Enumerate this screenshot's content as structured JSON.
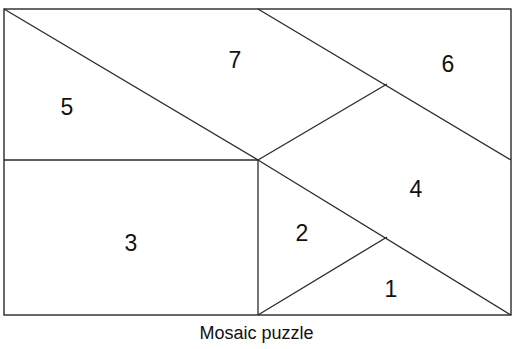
{
  "caption": "Mosaic puzzle",
  "colors": {
    "line": "#2a2a2a",
    "text": "#111111",
    "background": "#ffffff"
  },
  "frame": {
    "x1": 4,
    "y1": 9,
    "x2": 511,
    "y2": 315
  },
  "segments": [
    {
      "name": "diagonal-top-left-to-center",
      "x1": 4,
      "y1": 9,
      "x2": 258,
      "y2": 160
    },
    {
      "name": "diagonal-top-mid-to-right",
      "x1": 258,
      "y1": 9,
      "x2": 511,
      "y2": 160
    },
    {
      "name": "horizontal-left-mid",
      "x1": 4,
      "y1": 160,
      "x2": 258,
      "y2": 160
    },
    {
      "name": "vertical-center",
      "x1": 258,
      "y1": 160,
      "x2": 258,
      "y2": 315
    },
    {
      "name": "diagonal-center-up-right",
      "x1": 258,
      "y1": 160,
      "x2": 387,
      "y2": 84
    },
    {
      "name": "diagonal-center-to-bottom-right",
      "x1": 258,
      "y1": 160,
      "x2": 511,
      "y2": 315
    },
    {
      "name": "diagonal-bottom-center-up-right",
      "x1": 258,
      "y1": 315,
      "x2": 387,
      "y2": 237
    }
  ],
  "pieces": [
    {
      "id": "1",
      "label": "1",
      "x": 391,
      "y": 289
    },
    {
      "id": "2",
      "label": "2",
      "x": 302,
      "y": 233
    },
    {
      "id": "3",
      "label": "3",
      "x": 131,
      "y": 243
    },
    {
      "id": "4",
      "label": "4",
      "x": 416,
      "y": 189
    },
    {
      "id": "5",
      "label": "5",
      "x": 67,
      "y": 107
    },
    {
      "id": "6",
      "label": "6",
      "x": 448,
      "y": 64
    },
    {
      "id": "7",
      "label": "7",
      "x": 235,
      "y": 60
    }
  ]
}
